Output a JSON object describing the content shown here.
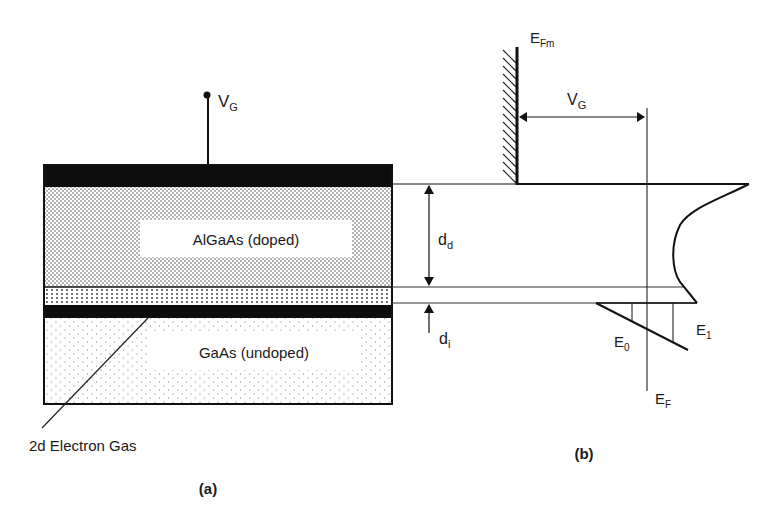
{
  "panel_a": {
    "caption": "(a)",
    "gate_voltage": {
      "main": "V",
      "sub": "G"
    },
    "layers": [
      {
        "name": "gate-metal",
        "label": ""
      },
      {
        "name": "algaas",
        "label": "AlGaAs (doped)"
      },
      {
        "name": "spacer",
        "label": ""
      },
      {
        "name": "2deg-channel",
        "label": ""
      },
      {
        "name": "gaas",
        "label": "GaAs (undoped)"
      }
    ],
    "dimensions": {
      "dd": {
        "main": "d",
        "sub": "d"
      },
      "di": {
        "main": "d",
        "sub": "i"
      }
    },
    "callout": "2d Electron Gas"
  },
  "panel_b": {
    "caption": "(b)",
    "metal_fermi": {
      "main": "E",
      "sub": "Fm"
    },
    "gate_voltage": {
      "main": "V",
      "sub": "G"
    },
    "fermi_level": {
      "main": "E",
      "sub": "F"
    },
    "subband_0": {
      "main": "E",
      "sub": "0"
    },
    "subband_1": {
      "main": "E",
      "sub": "1"
    }
  },
  "colors": {
    "ink": "#111111",
    "paper": "#ffffff"
  }
}
